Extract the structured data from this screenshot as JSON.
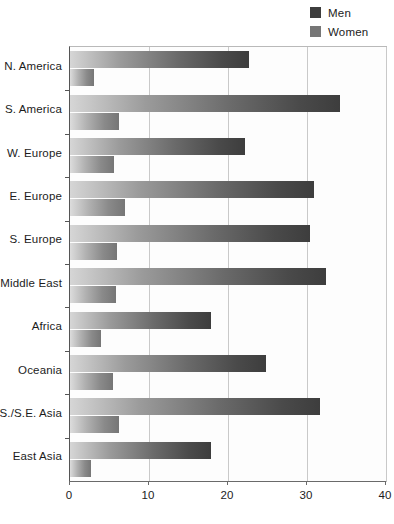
{
  "chart_data": {
    "type": "bar",
    "orientation": "horizontal",
    "title": "",
    "xlabel": "",
    "ylabel": "",
    "xlim": [
      0,
      40
    ],
    "xticks": [
      0,
      10,
      20,
      30,
      40
    ],
    "xtick_labels": [
      "0",
      "10",
      "20",
      "30",
      "40"
    ],
    "grid": true,
    "grid_axis": "x",
    "legend_position": "top-right",
    "categories": [
      "N. America",
      "S. America",
      "W. Europe",
      "E. Europe",
      "S. Europe",
      "Middle East",
      "Africa",
      "Oceania",
      "S./S.E. Asia",
      "East Asia"
    ],
    "series": [
      {
        "name": "Men",
        "color": "#3d3d3d",
        "values": [
          22.7,
          34.2,
          22.2,
          30.9,
          30.4,
          32.4,
          17.8,
          24.8,
          31.7,
          17.8
        ]
      },
      {
        "name": "Women",
        "color": "#767676",
        "values": [
          3.0,
          6.2,
          5.6,
          7.0,
          5.9,
          5.8,
          3.9,
          5.4,
          6.2,
          2.7
        ]
      }
    ]
  },
  "legend": {
    "items": [
      {
        "label": "Men",
        "color": "#3d3d3d"
      },
      {
        "label": "Women",
        "color": "#767676"
      }
    ]
  },
  "colors": {
    "men": "#3d3d3d",
    "women": "#767676",
    "grid": "#c9c9c9",
    "axis": "#555555",
    "background": "#ffffff",
    "plot_background": "#fdfdfd"
  }
}
